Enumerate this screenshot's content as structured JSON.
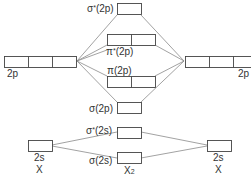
{
  "diagram": {
    "type": "molecular-orbital-diagram",
    "colors": {
      "line": "#8a8a8a",
      "box": "#444444",
      "text": "#333333"
    },
    "atoms": {
      "left": {
        "label": "X",
        "orbitals": [
          {
            "name": "2p",
            "label": "2p",
            "boxes": 3
          },
          {
            "name": "2s",
            "label": "2s",
            "boxes": 1
          }
        ]
      },
      "right": {
        "label": "X",
        "orbitals": [
          {
            "name": "2p",
            "label": "2p",
            "boxes": 3
          },
          {
            "name": "2s",
            "label": "2s",
            "boxes": 1
          }
        ]
      }
    },
    "molecule": {
      "label_main": "X",
      "label_sub": "2",
      "orbitals": [
        {
          "name": "sigma-star-2p",
          "label": "σ*(2p)",
          "greek": "σ",
          "star": "*",
          "ao": "(2p)",
          "boxes": 1
        },
        {
          "name": "pi-star-2p",
          "label": "π*(2p)",
          "greek": "π",
          "star": "*",
          "ao": "(2p)",
          "boxes": 2
        },
        {
          "name": "pi-2p",
          "label": "π(2p)",
          "greek": "π",
          "star": "",
          "ao": "(2p)",
          "boxes": 2
        },
        {
          "name": "sigma-2p",
          "label": "σ(2p)",
          "greek": "σ",
          "star": "",
          "ao": "(2p)",
          "boxes": 1
        },
        {
          "name": "sigma-star-2s",
          "label": "σ*(2s)",
          "greek": "σ",
          "star": "*",
          "ao": "(2s)",
          "boxes": 1
        },
        {
          "name": "sigma-2s",
          "label": "σ(2s)",
          "greek": "σ",
          "star": "",
          "ao": "(2s)",
          "boxes": 1
        }
      ]
    }
  }
}
